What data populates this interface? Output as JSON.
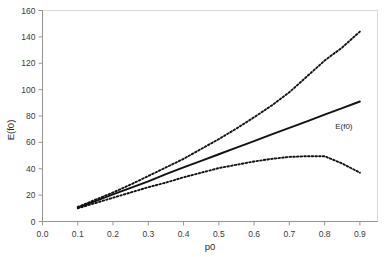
{
  "chart_data": {
    "type": "line",
    "title": "",
    "xlabel": "p0",
    "ylabel": "E(f0)",
    "xlim": [
      0.0,
      0.95
    ],
    "ylim": [
      0,
      160
    ],
    "grid": false,
    "legend": "annotation-inline",
    "xticks": [
      "0.0",
      "0.1",
      "0.2",
      "0.3",
      "0.4",
      "0.5",
      "0.6",
      "0.7",
      "0.8",
      "0.9"
    ],
    "xtick_values": [
      0.0,
      0.1,
      0.2,
      0.3,
      0.4,
      0.5,
      0.6,
      0.7,
      0.8,
      0.9
    ],
    "yticks": [
      "0",
      "20",
      "40",
      "60",
      "80",
      "100",
      "120",
      "140",
      "160"
    ],
    "ytick_values": [
      0,
      20,
      40,
      60,
      80,
      100,
      120,
      140,
      160
    ],
    "annotations": [
      {
        "text": "E(f0)",
        "x": 0.83,
        "y": 70
      }
    ],
    "x": [
      0.1,
      0.15,
      0.2,
      0.25,
      0.3,
      0.35,
      0.4,
      0.45,
      0.5,
      0.55,
      0.6,
      0.65,
      0.7,
      0.75,
      0.8,
      0.85,
      0.9
    ],
    "series": [
      {
        "name": "upper-bound",
        "style": "dotted",
        "values": [
          11.0,
          16.5,
          22.0,
          28.0,
          34.5,
          41.0,
          47.5,
          55.0,
          62.5,
          70.5,
          79.0,
          88.0,
          98.0,
          110.0,
          122.0,
          132.0,
          144.0
        ]
      },
      {
        "name": "E(f0)",
        "style": "solid",
        "values": [
          10.5,
          15.5,
          20.5,
          25.5,
          30.5,
          36.0,
          41.0,
          46.0,
          51.0,
          56.0,
          61.0,
          66.0,
          71.0,
          76.0,
          81.0,
          86.0,
          91.0
        ]
      },
      {
        "name": "lower-bound",
        "style": "dotted",
        "values": [
          10.0,
          14.0,
          18.0,
          22.0,
          26.0,
          29.5,
          33.5,
          37.0,
          40.5,
          43.0,
          45.5,
          47.5,
          49.0,
          49.5,
          49.5,
          44.0,
          37.0
        ]
      }
    ]
  }
}
